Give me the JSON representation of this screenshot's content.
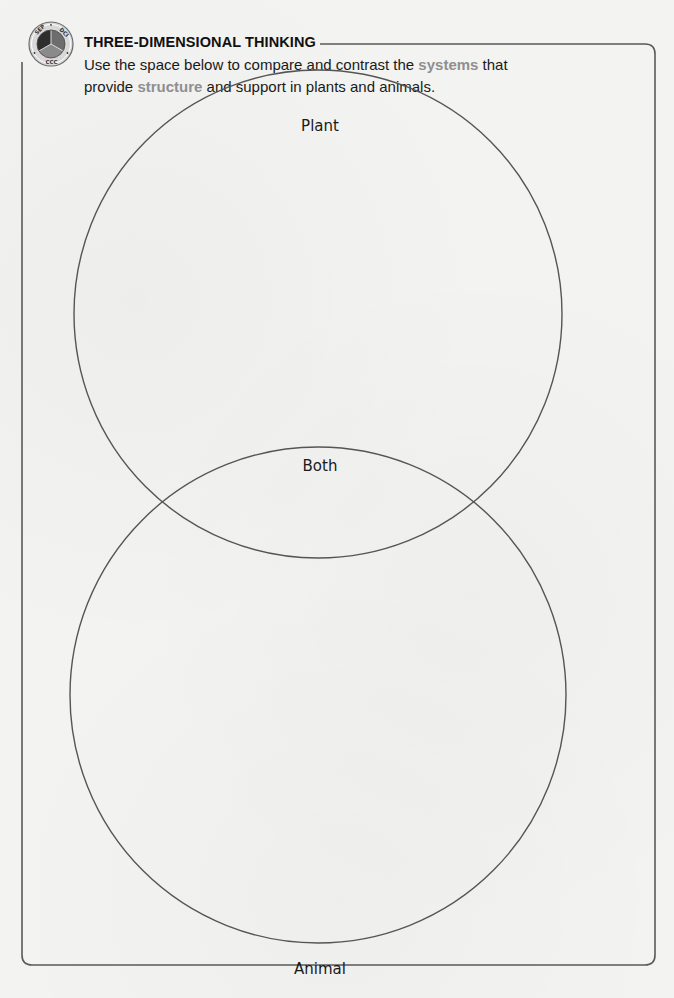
{
  "badge": {
    "segments": [
      "SEP",
      "DCI",
      "CCC"
    ],
    "colors": {
      "ring": "#c9c9c9",
      "seg_sep": "#3a3a3a",
      "seg_dci": "#6d6d6d",
      "seg_ccc": "#8a8a8a"
    }
  },
  "header": {
    "title": "THREE-DIMENSIONAL THINKING",
    "instructions": {
      "part1": "Use the space below to compare and contrast the ",
      "highlight1": "systems",
      "part2": " that provide ",
      "highlight2": "structure",
      "part3": " and support in plants and animals."
    },
    "highlight_color": "#8f8f8f"
  },
  "venn": {
    "circles": [
      {
        "label": "Plant"
      },
      {
        "label": "Animal"
      }
    ],
    "overlap_label": "Both",
    "stroke_color": "#555555"
  }
}
